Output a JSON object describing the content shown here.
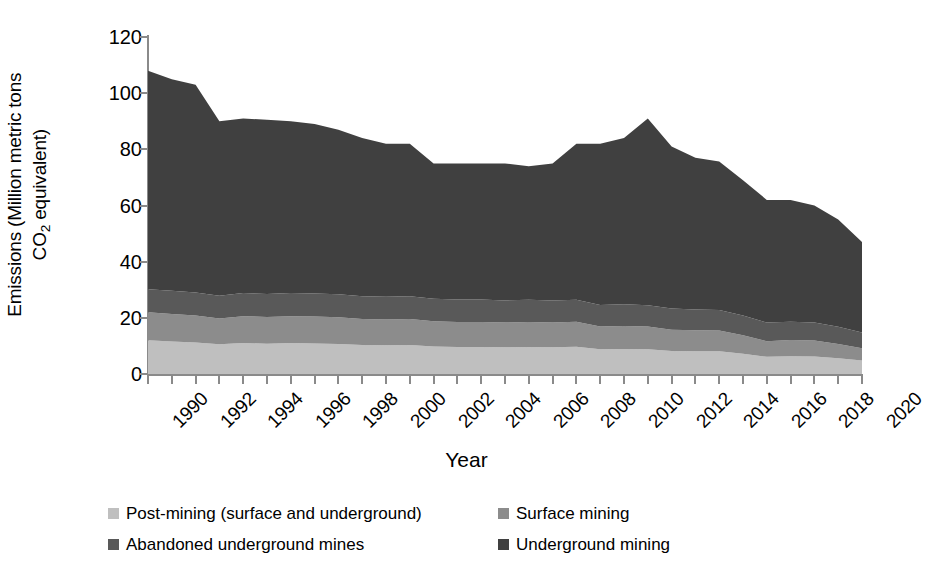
{
  "chart_data": {
    "type": "area",
    "stacked": true,
    "title": "",
    "xlabel": "Year",
    "ylabel": "Emissions (Million metric tons CO2 equivalent)",
    "ylabel_line1": "Emissions (Million metric tons",
    "ylabel_line2_pre": "CO",
    "ylabel_line2_sub": "2",
    "ylabel_line2_post": " equivalent)",
    "ylim": [
      0,
      120
    ],
    "yticks": [
      0,
      20,
      40,
      60,
      80,
      100,
      120
    ],
    "xlim": [
      1990,
      2020
    ],
    "xticks": [
      1990,
      1992,
      1994,
      1996,
      1998,
      2000,
      2002,
      2004,
      2006,
      2008,
      2010,
      2012,
      2014,
      2016,
      2018,
      2020
    ],
    "grid": false,
    "legend_position": "bottom",
    "x": [
      1990,
      1991,
      1992,
      1993,
      1994,
      1995,
      1996,
      1997,
      1998,
      1999,
      2000,
      2001,
      2002,
      2003,
      2004,
      2005,
      2006,
      2007,
      2008,
      2009,
      2010,
      2011,
      2012,
      2013,
      2014,
      2015,
      2016,
      2017,
      2018,
      2019,
      2020
    ],
    "series": [
      {
        "name": "Post-mining (surface and underground)",
        "color": "#bfbfbf",
        "values": [
          12.0,
          11.6,
          11.2,
          10.6,
          11.0,
          10.8,
          11.0,
          10.9,
          10.7,
          10.3,
          10.2,
          10.3,
          9.8,
          9.6,
          9.6,
          9.5,
          9.6,
          9.5,
          9.7,
          8.8,
          8.9,
          8.8,
          8.2,
          8.1,
          8.1,
          7.2,
          6.1,
          6.3,
          6.2,
          5.6,
          4.8
        ]
      },
      {
        "name": "Surface mining",
        "color": "#8c8c8c",
        "values": [
          10.0,
          9.8,
          9.6,
          9.2,
          9.6,
          9.5,
          9.6,
          9.6,
          9.5,
          9.3,
          9.2,
          9.3,
          9.0,
          8.9,
          8.9,
          8.8,
          8.9,
          8.8,
          8.9,
          8.1,
          8.2,
          8.1,
          7.6,
          7.5,
          7.4,
          6.6,
          5.6,
          5.8,
          5.7,
          5.1,
          4.4
        ]
      },
      {
        "name": "Abandoned underground mines",
        "color": "#595959",
        "values": [
          8.2,
          8.2,
          8.2,
          8.1,
          8.2,
          8.2,
          8.2,
          8.2,
          8.2,
          8.1,
          8.1,
          8.1,
          8.0,
          8.0,
          8.0,
          7.9,
          7.9,
          7.9,
          7.8,
          7.7,
          7.7,
          7.6,
          7.5,
          7.4,
          7.3,
          7.0,
          6.6,
          6.5,
          6.4,
          6.1,
          5.6
        ]
      },
      {
        "name": "Underground mining",
        "color": "#404040",
        "values": [
          77.8,
          75.4,
          74.0,
          62.1,
          62.2,
          62.0,
          61.2,
          60.3,
          58.6,
          56.3,
          54.5,
          54.3,
          48.2,
          48.5,
          48.5,
          48.8,
          47.6,
          48.8,
          55.6,
          57.4,
          59.2,
          66.5,
          57.7,
          54.0,
          52.9,
          48.2,
          43.7,
          43.4,
          41.7,
          38.2,
          32.2
        ]
      }
    ],
    "totals": [
      108.0,
      105.0,
      103.0,
      90.0,
      91.0,
      90.5,
      90.0,
      89.0,
      87.0,
      84.0,
      82.0,
      82.0,
      75.0,
      75.0,
      75.0,
      75.0,
      74.0,
      75.0,
      82.0,
      82.0,
      84.0,
      91.0,
      81.0,
      77.0,
      75.7,
      69.0,
      62.0,
      62.0,
      60.0,
      55.0,
      47.0
    ]
  },
  "legend": {
    "items": [
      {
        "label": "Post-mining (surface and underground)",
        "color": "#bfbfbf"
      },
      {
        "label": "Surface mining",
        "color": "#8c8c8c"
      },
      {
        "label": "Abandoned underground mines",
        "color": "#595959"
      },
      {
        "label": "Underground mining",
        "color": "#404040"
      }
    ]
  },
  "axis": {
    "y_tick_labels": [
      "120",
      "100",
      "80",
      "60",
      "40",
      "20",
      "0"
    ],
    "x_tick_labels": [
      "1990",
      "1992",
      "1994",
      "1996",
      "1998",
      "2000",
      "2002",
      "2004",
      "2006",
      "2008",
      "2010",
      "2012",
      "2014",
      "2016",
      "2018",
      "2020"
    ],
    "x_title": "Year"
  }
}
